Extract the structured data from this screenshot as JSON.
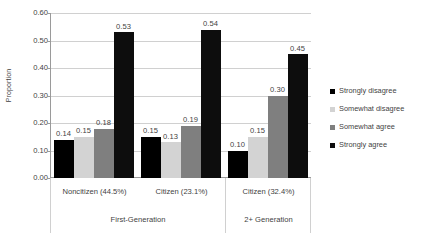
{
  "chart_data": {
    "type": "bar",
    "title": "",
    "xlabel": "",
    "ylabel": "Proportion",
    "ylim": [
      0.0,
      0.6
    ],
    "ytick_labels": [
      "0.60",
      "0.50",
      "0.40",
      "0.30",
      "0.20",
      "0.10",
      "0.00"
    ],
    "ytick_values": [
      0.6,
      0.5,
      0.4,
      0.3,
      0.2,
      0.1,
      0.0
    ],
    "grid": true,
    "legend_position": "right",
    "categories": [
      "Noncitizen (44.5%)",
      "Citizen (23.1%)",
      "Citizen (32.4%)"
    ],
    "group_labels": [
      "First-Generation",
      "2+ Generation"
    ],
    "group_spans": [
      2,
      1
    ],
    "series": [
      {
        "name": "Strongly disagree",
        "color": "#000000",
        "values": [
          0.14,
          0.15,
          0.1
        ]
      },
      {
        "name": "Somewhat disagree",
        "color": "#d3d3d3",
        "values": [
          0.15,
          0.13,
          0.15
        ]
      },
      {
        "name": "Somewhat agree",
        "color": "#7f7f7f",
        "values": [
          0.18,
          0.19,
          0.3
        ]
      },
      {
        "name": "Strongly agree",
        "color": "#0d0d0d",
        "values": [
          0.53,
          0.54,
          0.45
        ]
      }
    ],
    "data_labels": [
      [
        "0.14",
        "0.15",
        "0.18",
        "0.53"
      ],
      [
        "0.15",
        "0.13",
        "0.19",
        "0.54"
      ],
      [
        "0.10",
        "0.15",
        "0.30",
        "0.45"
      ]
    ]
  },
  "axis": {
    "y_title": "Proportion",
    "ticks": [
      {
        "label": "0.60",
        "value": 0.6
      },
      {
        "label": "0.50",
        "value": 0.5
      },
      {
        "label": "0.40",
        "value": 0.4
      },
      {
        "label": "0.30",
        "value": 0.3
      },
      {
        "label": "0.20",
        "value": 0.2
      },
      {
        "label": "0.10",
        "value": 0.1
      },
      {
        "label": "0.00",
        "value": 0.0
      }
    ]
  },
  "legend": {
    "items": [
      {
        "label": "Strongly disagree",
        "color": "#000000"
      },
      {
        "label": "Somewhat disagree",
        "color": "#d3d3d3"
      },
      {
        "label": "Somewhat agree",
        "color": "#7f7f7f"
      },
      {
        "label": "Strongly agree",
        "color": "#0d0d0d"
      }
    ]
  },
  "category_axis": {
    "tier1": [
      "Noncitizen (44.5%)",
      "Citizen (23.1%)",
      "Citizen (32.4%)"
    ],
    "tier2": [
      "First-Generation",
      "2+ Generation"
    ]
  }
}
